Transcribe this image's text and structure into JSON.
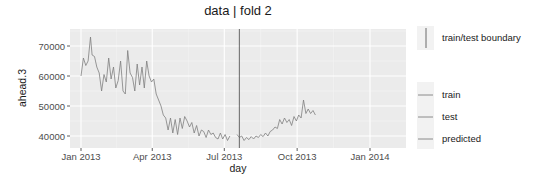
{
  "chart_data": {
    "type": "line",
    "title": "data | fold 2",
    "xlabel": "day",
    "ylabel": "ahead.3",
    "x_ticks": [
      "Jan 2013",
      "Apr 2013",
      "Jul 2013",
      "Oct 2013",
      "Jan 2014"
    ],
    "y_ticks": [
      "40000",
      "50000",
      "60000",
      "70000"
    ],
    "ylim": [
      36500,
      76000
    ],
    "xlim": [
      "2012-12-10",
      "2014-02-15"
    ],
    "grid": true,
    "legend_position": "right",
    "boundary": {
      "x": "2013-07-20",
      "label": "train/test boundary"
    },
    "legend": {
      "boundary_label": "train/test boundary",
      "entries": [
        "train",
        "test",
        "predicted"
      ]
    },
    "colors": {
      "panel": "#ebebeb",
      "grid": "#ffffff",
      "line": "#7f7f7f",
      "boundary": "#595959"
    },
    "series": [
      {
        "name": "train",
        "points": [
          [
            0,
            60000
          ],
          [
            3,
            66000
          ],
          [
            6,
            63500
          ],
          [
            9,
            65000
          ],
          [
            12,
            73000
          ],
          [
            14,
            67000
          ],
          [
            17,
            66500
          ],
          [
            20,
            63000
          ],
          [
            23,
            61000
          ],
          [
            26,
            55000
          ],
          [
            29,
            60500
          ],
          [
            32,
            58000
          ],
          [
            35,
            66000
          ],
          [
            38,
            59000
          ],
          [
            41,
            63000
          ],
          [
            44,
            56000
          ],
          [
            47,
            58500
          ],
          [
            50,
            65000
          ],
          [
            53,
            55000
          ],
          [
            56,
            54000
          ],
          [
            59,
            68500
          ],
          [
            62,
            61000
          ],
          [
            65,
            59500
          ],
          [
            68,
            55000
          ],
          [
            71,
            64000
          ],
          [
            74,
            57000
          ],
          [
            77,
            63000
          ],
          [
            80,
            56000
          ],
          [
            83,
            65000
          ],
          [
            86,
            60000
          ],
          [
            89,
            58000
          ],
          [
            92,
            59000
          ],
          [
            95,
            54000
          ],
          [
            98,
            52000
          ],
          [
            101,
            50000
          ],
          [
            104,
            47000
          ],
          [
            107,
            46000
          ],
          [
            110,
            42000
          ],
          [
            113,
            46000
          ],
          [
            116,
            41000
          ],
          [
            119,
            45500
          ],
          [
            122,
            40500
          ],
          [
            125,
            46000
          ],
          [
            128,
            42500
          ],
          [
            131,
            46500
          ],
          [
            134,
            45000
          ],
          [
            137,
            43000
          ],
          [
            140,
            44500
          ],
          [
            143,
            41000
          ],
          [
            146,
            43500
          ],
          [
            149,
            40000
          ],
          [
            152,
            42000
          ],
          [
            155,
            41500
          ],
          [
            158,
            39500
          ],
          [
            161,
            42000
          ],
          [
            164,
            40500
          ],
          [
            167,
            41000
          ],
          [
            170,
            39500
          ],
          [
            173,
            39000
          ],
          [
            176,
            41000
          ],
          [
            179,
            39000
          ],
          [
            182,
            40500
          ],
          [
            185,
            38500
          ],
          [
            188,
            40000
          ]
        ]
      },
      {
        "name": "test",
        "points": [
          [
            197,
            40500
          ],
          [
            200,
            39500
          ],
          [
            203,
            40000
          ],
          [
            206,
            38500
          ],
          [
            209,
            39500
          ],
          [
            212,
            38800
          ],
          [
            215,
            39800
          ],
          [
            218,
            39000
          ],
          [
            221,
            40000
          ],
          [
            224,
            39500
          ],
          [
            227,
            40500
          ],
          [
            230,
            39800
          ],
          [
            233,
            41000
          ],
          [
            236,
            40000
          ],
          [
            239,
            41500
          ],
          [
            242,
            42000
          ],
          [
            245,
            43000
          ],
          [
            248,
            42500
          ],
          [
            251,
            45500
          ],
          [
            254,
            44000
          ],
          [
            257,
            46000
          ],
          [
            260,
            44500
          ],
          [
            263,
            45500
          ],
          [
            266,
            43500
          ],
          [
            269,
            46500
          ],
          [
            272,
            45000
          ],
          [
            275,
            47000
          ],
          [
            278,
            46000
          ],
          [
            281,
            52000
          ],
          [
            284,
            47500
          ],
          [
            287,
            49000
          ],
          [
            290,
            47500
          ],
          [
            293,
            48500
          ],
          [
            296,
            47000
          ]
        ]
      },
      {
        "name": "predicted",
        "points": []
      }
    ]
  }
}
